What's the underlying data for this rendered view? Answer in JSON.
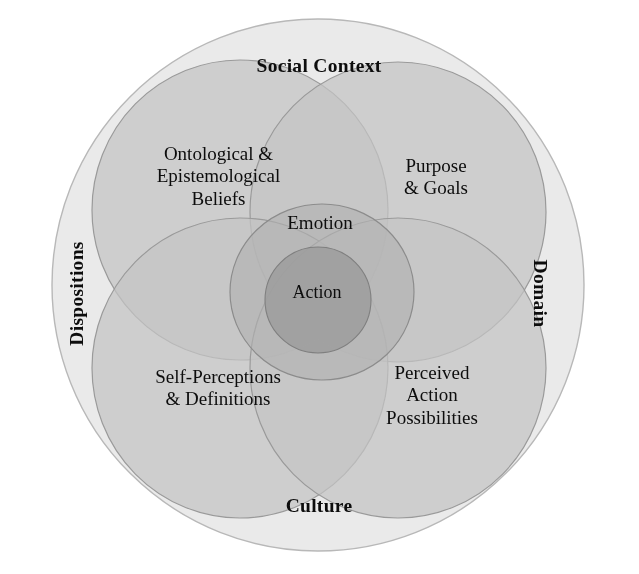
{
  "diagram": {
    "title": "Social Context",
    "type": "nested-venn",
    "outer_ring": {
      "top_label": "Social Context",
      "bottom_label": "Culture",
      "left_label": "Dispositions",
      "right_label": "Domain"
    },
    "quadrants": [
      {
        "id": "ontological",
        "label": "Ontological &\nEpistemological\nBeliefs",
        "position": "top-left"
      },
      {
        "id": "purpose",
        "label": "Purpose\n& Goals",
        "position": "top-right"
      },
      {
        "id": "self-perception",
        "label": "Self-Perceptions\n& Definitions",
        "position": "bottom-left"
      },
      {
        "id": "perceived-action",
        "label": "Perceived\nAction\nPossibilities",
        "position": "bottom-right"
      }
    ],
    "core": [
      {
        "id": "emotion",
        "label": "Emotion"
      },
      {
        "id": "action",
        "label": "Action"
      }
    ],
    "colors": {
      "background": "#ffffff",
      "outer_ring_fill": "#eaeaea",
      "outer_ring_stroke": "#b8b8b8",
      "lobe_fill": "#b9b9b9",
      "lobe_stroke": "#9a9a9a",
      "emotion_fill": "#aeaeae",
      "emotion_stroke": "#8c8c8c",
      "action_fill": "#9a9a9a",
      "action_stroke": "#7f7f7f",
      "text": "#0d0d0d"
    },
    "geometry": {
      "outer_circle": {
        "cx": 318,
        "cy": 285,
        "r": 266
      },
      "lobes": [
        {
          "id": "ontological",
          "cx": 240,
          "cy": 210,
          "rx": 148,
          "ry": 150
        },
        {
          "id": "purpose",
          "cx": 398,
          "cy": 212,
          "rx": 148,
          "ry": 150
        },
        {
          "id": "self-perception",
          "cx": 240,
          "cy": 368,
          "rx": 148,
          "ry": 150
        },
        {
          "id": "perceived-action",
          "cx": 398,
          "cy": 368,
          "rx": 148,
          "ry": 150
        }
      ],
      "emotion_ellipse": {
        "cx": 322,
        "cy": 292,
        "rx": 92,
        "ry": 88
      },
      "action_circle": {
        "cx": 318,
        "cy": 300,
        "r": 53
      }
    }
  }
}
